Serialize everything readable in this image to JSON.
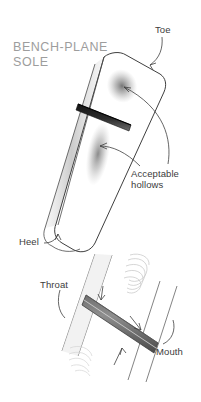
{
  "figure": {
    "title": "BENCH-PLANE\nSOLE",
    "background_color": "#ffffff",
    "outline_color": "#3f3f3f",
    "label_color": "#3c3c3c",
    "title_color": "#9d9d9d",
    "slot_color": "#1f1f1f",
    "hollow_color": "#8a8a8a",
    "width": 201,
    "height": 402
  },
  "labels": {
    "toe": "Toe",
    "acceptable_hollows": "Acceptable\nhollows",
    "heel": "Heel",
    "throat": "Throat",
    "mouth": "Mouth"
  },
  "views": {
    "main": {
      "name": "bench-plane-sole-overview",
      "description": "Angled view of a bench plane sole showing the toe end, heel end, mouth slot and two shaded hollow areas"
    },
    "detail": {
      "name": "mouth-detail",
      "description": "Close-up detail of the plane mouth showing throat and mouth edges with light hatching"
    }
  }
}
